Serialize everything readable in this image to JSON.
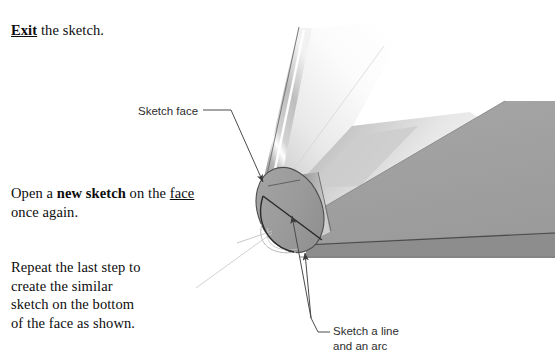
{
  "document": {
    "title": "SolidWorks sketch tutorial step illustration",
    "background_color": "#ffffff",
    "text_color": "#0d0d0d"
  },
  "instructions": [
    {
      "id": "exit",
      "emphasis_word": "Exit",
      "emphasis_style": "bold-underline",
      "rest": " the sketch."
    },
    {
      "id": "open-new-sketch",
      "line1_prefix": "Open a ",
      "line1_bold": "new sketch",
      "line1_suffix": " on the",
      "line2_underlined": "face",
      "line2_suffix": " once again."
    },
    {
      "id": "repeat-step",
      "text": "Repeat the last step to\ncreate the similar\nsketch on the bottom\nof the face as shown."
    }
  ],
  "callouts": [
    {
      "id": "sketch-face",
      "text": "Sketch face",
      "font": "sans-serif",
      "color": "#2e2e2e",
      "leader": "horizontal-then-diagonal-arrow",
      "points_to": "elliptical end face of cylinder"
    },
    {
      "id": "sketch-line-and-arc",
      "text": "Sketch a line\nand an arc",
      "font": "sans-serif",
      "color": "#2e2e2e",
      "leader": "elbow-then-two-arrows",
      "points_to": "line and arc drawn on the end face"
    }
  ],
  "model": {
    "description": "Shaded 3D CAD solid: a tapered swept body with a rounded cylindrical end cap shown as an ellipse, viewed from the lower-left.",
    "colors": {
      "face_light": "#e8e8e8",
      "face_mid": "#a9a9a9",
      "face_gray": "#9a9a9a",
      "face_dark": "#8a8a8a",
      "edge_dark": "#3a3a3a",
      "highlight": "#ffffff",
      "construction_line": "#bdbdbd",
      "sketch_line": "#2b2b2b",
      "leader_line": "#4a4a4a"
    },
    "entities": [
      {
        "name": "end-face-ellipse",
        "type": "ellipse",
        "shading": "flat mid gray"
      },
      {
        "name": "sketch-chord-line",
        "type": "line",
        "on": "end-face-ellipse"
      },
      {
        "name": "sketch-arc",
        "type": "arc",
        "on": "end-face-ellipse"
      },
      {
        "name": "upper-swept-band",
        "type": "surface",
        "shading": "gradient with specular highlight"
      },
      {
        "name": "lower-wedge-face",
        "type": "surface",
        "shading": "flat gray"
      },
      {
        "name": "bottom-edge-strip",
        "type": "surface",
        "shading": "darker gray"
      },
      {
        "name": "construction-axis",
        "type": "line",
        "style": "faint light gray"
      }
    ]
  }
}
